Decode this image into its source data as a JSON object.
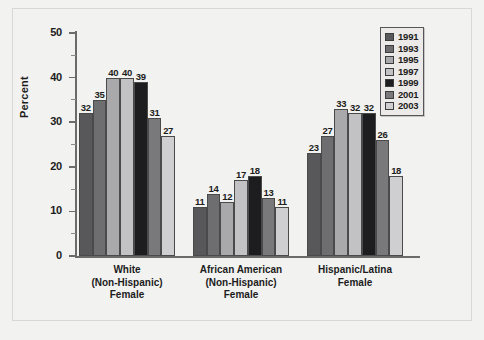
{
  "chart_data": {
    "type": "bar",
    "title": "",
    "subtitle": "",
    "xlabel": "",
    "ylabel": "Percent",
    "ylim": [
      0,
      50
    ],
    "y_ticks": [
      0,
      10,
      20,
      30,
      40,
      50
    ],
    "y_minor_ticks": [
      5,
      15,
      25,
      35,
      45
    ],
    "grid": false,
    "legend_position": "top-right",
    "categories": [
      "White\n(Non-Hispanic)\nFemale",
      "African American\n(Non-Hispanic)\nFemale",
      "Hispanic/Latina\nFemale"
    ],
    "category_lines": [
      [
        "White",
        "(Non-Hispanic)",
        "Female"
      ],
      [
        "African American",
        "(Non-Hispanic)",
        "Female"
      ],
      [
        "Hispanic/Latina",
        "Female"
      ]
    ],
    "series": [
      {
        "name": "1991",
        "color": "#58585a",
        "values": [
          32,
          11,
          23
        ]
      },
      {
        "name": "1993",
        "color": "#6e6e70",
        "values": [
          35,
          14,
          27
        ]
      },
      {
        "name": "1995",
        "color": "#a9a9ab",
        "values": [
          40,
          12,
          33
        ]
      },
      {
        "name": "1997",
        "color": "#c2c2c4",
        "values": [
          40,
          17,
          32
        ]
      },
      {
        "name": "1999",
        "color": "#1d1d1f",
        "values": [
          39,
          18,
          32
        ]
      },
      {
        "name": "2001",
        "color": "#79797b",
        "values": [
          31,
          13,
          26
        ]
      },
      {
        "name": "2003",
        "color": "#cfcfd1",
        "values": [
          27,
          11,
          18
        ]
      }
    ]
  },
  "legend": {
    "items": [
      {
        "label": "1991",
        "color": "#58585a"
      },
      {
        "label": "1993",
        "color": "#6e6e70"
      },
      {
        "label": "1995",
        "color": "#a9a9ab"
      },
      {
        "label": "1997",
        "color": "#c2c2c4"
      },
      {
        "label": "1999",
        "color": "#1d1d1f"
      },
      {
        "label": "2001",
        "color": "#79797b"
      },
      {
        "label": "2003",
        "color": "#cfcfd1"
      }
    ]
  },
  "axis": {
    "y_title": "Percent",
    "y_tick_labels": [
      "0",
      "10",
      "20",
      "30",
      "40",
      "50"
    ]
  },
  "colors": {
    "background": "#f2f2f0",
    "axis": "#6b6b6b",
    "text": "#1c1c1c",
    "bar_outline": "#4a4a4a"
  }
}
